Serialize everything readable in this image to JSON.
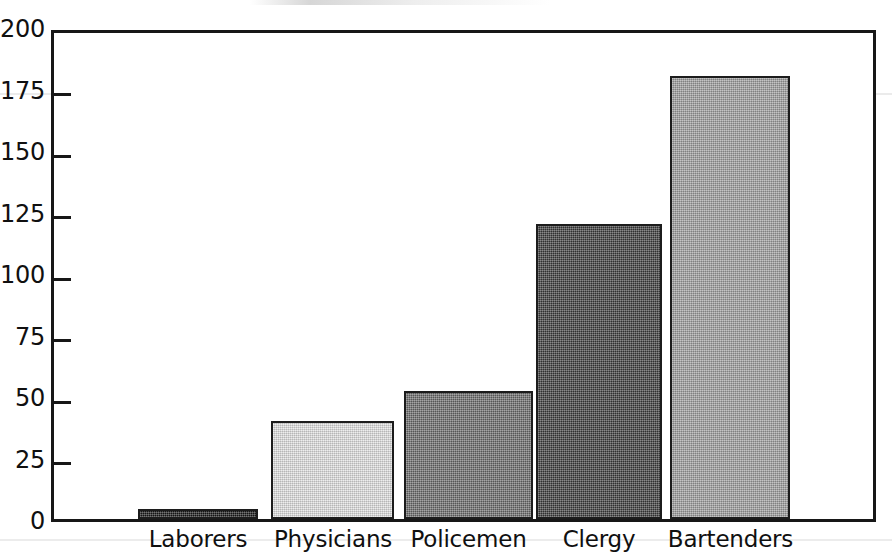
{
  "chart_data": {
    "type": "bar",
    "title": "",
    "subtitle": "",
    "xlabel": "",
    "ylabel": "",
    "categories": [
      "Laborers",
      "Physicians",
      "Policemen",
      "Clergy",
      "Bartenders"
    ],
    "values": [
      4,
      40,
      52,
      120,
      180
    ],
    "ylim": [
      0,
      200
    ],
    "yticks": [
      0,
      25,
      50,
      75,
      100,
      125,
      150,
      175,
      200
    ],
    "ytick_labels": [
      "0",
      "25",
      "50",
      "75",
      "100",
      "125",
      "150",
      "175",
      "200"
    ],
    "grid": false,
    "legend": "none",
    "bar_colors": [
      "#1a1a1a",
      "#e3e3e3",
      "#6b6b6b",
      "#3c3c3c",
      "#9e9e9e"
    ],
    "axis_color": "#171717",
    "background_color": "#ffffff",
    "bars": [
      {
        "category": "Laborers",
        "value": 4,
        "color": "#1a1a1a"
      },
      {
        "category": "Physicians",
        "value": 40,
        "color": "#e3e3e3"
      },
      {
        "category": "Policemen",
        "value": 52,
        "color": "#6b6b6b"
      },
      {
        "category": "Clergy",
        "value": 120,
        "color": "#3c3c3c"
      },
      {
        "category": "Bartenders",
        "value": 180,
        "color": "#9e9e9e"
      }
    ]
  },
  "geometry": {
    "plot_left": 51,
    "plot_top": 30,
    "plot_width": 825,
    "plot_height": 492,
    "bar_positions": [
      {
        "left": 138,
        "width": 120
      },
      {
        "left": 271,
        "width": 123
      },
      {
        "left": 404,
        "width": 129
      },
      {
        "left": 536,
        "width": 126
      },
      {
        "left": 670,
        "width": 120
      }
    ],
    "label_positions": [
      {
        "left": 128,
        "width": 140
      },
      {
        "left": 258,
        "width": 150
      },
      {
        "left": 396,
        "width": 145
      },
      {
        "left": 529,
        "width": 140
      },
      {
        "left": 658,
        "width": 145
      }
    ]
  }
}
